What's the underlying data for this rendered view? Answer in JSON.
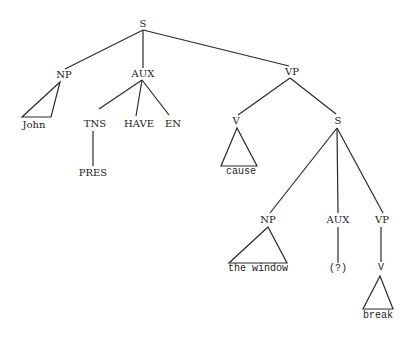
{
  "diagram": {
    "type": "syntax-tree",
    "colors": {
      "line": "#2a2a2a",
      "text": "#222222",
      "background": "#ffffff"
    },
    "nodes": {
      "s_root": "S",
      "np_subject": "NP",
      "john": "John",
      "aux_main": "AUX",
      "tns": "TNS",
      "pres": "PRES",
      "have": "HAVE",
      "en": "EN",
      "vp_main": "VP",
      "v_main": "V",
      "cause": "cause",
      "s_embedded": "S",
      "np_embedded": "NP",
      "the_window": "the window",
      "aux_embedded": "AUX",
      "aux_unknown": "(?)",
      "vp_embedded": "VP",
      "v_embedded": "V",
      "break": "break"
    },
    "edges": [
      [
        "S",
        "NP"
      ],
      [
        "S",
        "AUX"
      ],
      [
        "S",
        "VP"
      ],
      [
        "NP",
        "John (triangle)"
      ],
      [
        "AUX",
        "TNS"
      ],
      [
        "AUX",
        "HAVE"
      ],
      [
        "AUX",
        "EN"
      ],
      [
        "TNS",
        "PRES"
      ],
      [
        "VP",
        "V"
      ],
      [
        "VP",
        "S"
      ],
      [
        "V",
        "cause (triangle)"
      ],
      [
        "S",
        "NP"
      ],
      [
        "S",
        "AUX"
      ],
      [
        "S",
        "VP"
      ],
      [
        "NP",
        "the window (triangle)"
      ],
      [
        "AUX",
        "(?)"
      ],
      [
        "VP",
        "V"
      ],
      [
        "V",
        "break (triangle)"
      ]
    ]
  }
}
